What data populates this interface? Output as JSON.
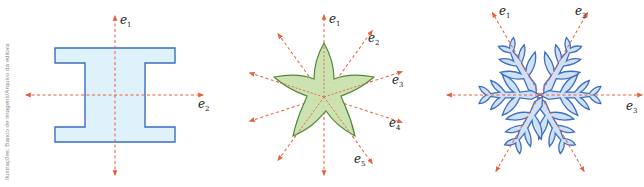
{
  "credit": "Ilustrações: Banco de imagens/Arquivo da editora",
  "colors": {
    "axis": "#e8603c",
    "ibeam_fill": "#dff1fb",
    "ibeam_stroke": "#3a6fc0",
    "star_fill": "#c8dfaa",
    "star_stroke": "#4f8a3a",
    "flake_fill": "#cfe1f7",
    "flake_stroke": "#3f6fbf"
  },
  "figures": [
    {
      "name": "i-beam",
      "axes": [
        {
          "base": "e",
          "sub": "1"
        },
        {
          "base": "e",
          "sub": "2"
        }
      ]
    },
    {
      "name": "star",
      "axes": [
        {
          "base": "e",
          "sub": "1"
        },
        {
          "base": "e",
          "sub": "2"
        },
        {
          "base": "e",
          "sub": "3"
        },
        {
          "base": "e",
          "sub": "4"
        },
        {
          "base": "e",
          "sub": "5"
        }
      ]
    },
    {
      "name": "snowflake",
      "axes": [
        {
          "base": "e",
          "sub": "1"
        },
        {
          "base": "e",
          "sub": "2"
        },
        {
          "base": "e",
          "sub": "3"
        }
      ]
    }
  ]
}
